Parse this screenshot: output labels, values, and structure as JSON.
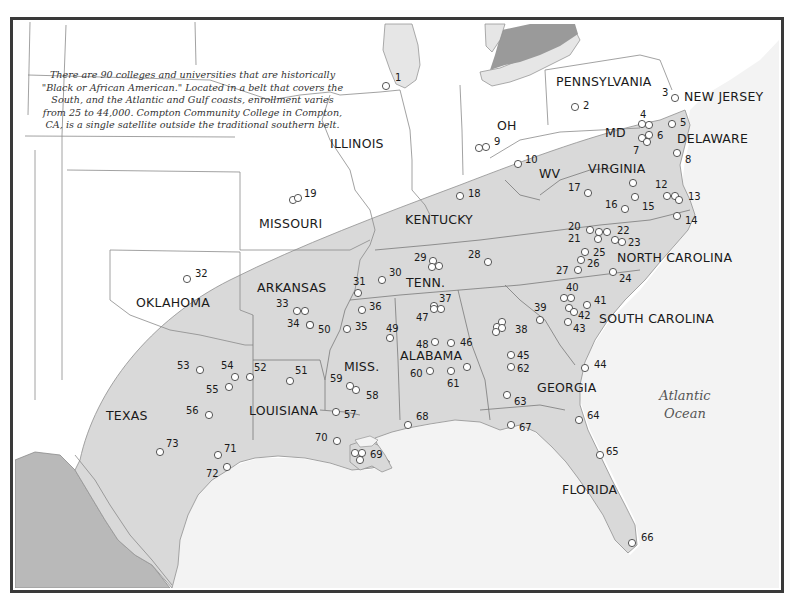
{
  "map": {
    "caption": "There are 90 colleges and universities that are historically \"Black or African American.\" Located in a belt that covers the South, and the Atlantic and Gulf coasts, enrollment varies from 25 to 44,000. Compton Community College in Compton, CA, is a single satellite outside the traditional southern belt.",
    "colors": {
      "belt": "#d9d9d9",
      "mexico": "#b9b9b9",
      "lakes": "#e6e6e6",
      "ontario": "#9a9a9a",
      "ocean": "#f3f3f3",
      "land": "#ffffff",
      "frame": "#3a3a3a"
    },
    "ocean_label": {
      "line1": "Atlantic",
      "line2": "Ocean"
    },
    "state_labels": [
      {
        "name": "PENNSYLVANIA",
        "x": 556,
        "y": 86
      },
      {
        "name": "NEW JERSEY",
        "x": 684,
        "y": 101
      },
      {
        "name": "ILLINOIS",
        "x": 330,
        "y": 148
      },
      {
        "name": "OH",
        "x": 497,
        "y": 130
      },
      {
        "name": "MD",
        "x": 605,
        "y": 137
      },
      {
        "name": "DELAWARE",
        "x": 677,
        "y": 143
      },
      {
        "name": "WV",
        "x": 539,
        "y": 178
      },
      {
        "name": "VIRGINIA",
        "x": 588,
        "y": 173
      },
      {
        "name": "MISSOURI",
        "x": 259,
        "y": 228
      },
      {
        "name": "KENTUCKY",
        "x": 405,
        "y": 224
      },
      {
        "name": "NORTH CAROLINA",
        "x": 617,
        "y": 262
      },
      {
        "name": "ARKANSAS",
        "x": 257,
        "y": 292
      },
      {
        "name": "TENN.",
        "x": 406,
        "y": 287
      },
      {
        "name": "OKLAHOMA",
        "x": 136,
        "y": 307
      },
      {
        "name": "SOUTH CAROLINA",
        "x": 599,
        "y": 323
      },
      {
        "name": "MISS.",
        "x": 344,
        "y": 371
      },
      {
        "name": "ALABAMA",
        "x": 400,
        "y": 360
      },
      {
        "name": "GEORGIA",
        "x": 537,
        "y": 392
      },
      {
        "name": "TEXAS",
        "x": 106,
        "y": 420
      },
      {
        "name": "LOUISIANA",
        "x": 249,
        "y": 415
      },
      {
        "name": "FLORIDA",
        "x": 562,
        "y": 494
      }
    ],
    "colleges": [
      {
        "id": "1",
        "x": 386,
        "y": 86,
        "lx": 395,
        "ly": 81
      },
      {
        "id": "2",
        "x": 575,
        "y": 107,
        "lx": 583,
        "ly": 109
      },
      {
        "id": "3",
        "x": 675,
        "y": 98,
        "lx": 662,
        "ly": 96
      },
      {
        "id": "4",
        "x": 642,
        "y": 124,
        "lx": 640,
        "ly": 118
      },
      {
        "id": "4b",
        "x": 649,
        "y": 125,
        "lx": null,
        "ly": null
      },
      {
        "id": "5",
        "x": 672,
        "y": 124,
        "lx": 680,
        "ly": 126
      },
      {
        "id": "6",
        "x": 649,
        "y": 135,
        "lx": 657,
        "ly": 139
      },
      {
        "id": "6b",
        "x": 642,
        "y": 138,
        "lx": null,
        "ly": null
      },
      {
        "id": "7",
        "x": 647,
        "y": 142,
        "lx": 633,
        "ly": 154
      },
      {
        "id": "8",
        "x": 677,
        "y": 153,
        "lx": 685,
        "ly": 163
      },
      {
        "id": "9",
        "x": 479,
        "y": 148,
        "lx": 494,
        "ly": 145
      },
      {
        "id": "9b",
        "x": 486,
        "y": 147,
        "lx": null,
        "ly": null
      },
      {
        "id": "10",
        "x": 518,
        "y": 164,
        "lx": 525,
        "ly": 163
      },
      {
        "id": "11",
        "x": 633,
        "y": 183,
        "lx": null,
        "ly": null
      },
      {
        "id": "12",
        "x": 667,
        "y": 196,
        "lx": 655,
        "ly": 188
      },
      {
        "id": "13",
        "x": 675,
        "y": 196,
        "lx": 688,
        "ly": 200
      },
      {
        "id": "13b",
        "x": 679,
        "y": 200,
        "lx": null,
        "ly": null
      },
      {
        "id": "14",
        "x": 677,
        "y": 216,
        "lx": 685,
        "ly": 224
      },
      {
        "id": "15",
        "x": 635,
        "y": 197,
        "lx": 642,
        "ly": 210
      },
      {
        "id": "16",
        "x": 625,
        "y": 209,
        "lx": 605,
        "ly": 208
      },
      {
        "id": "17",
        "x": 588,
        "y": 193,
        "lx": 568,
        "ly": 191
      },
      {
        "id": "18",
        "x": 460,
        "y": 196,
        "lx": 468,
        "ly": 197
      },
      {
        "id": "19",
        "x": 293,
        "y": 200,
        "lx": 304,
        "ly": 197
      },
      {
        "id": "19b",
        "x": 298,
        "y": 198,
        "lx": null,
        "ly": null
      },
      {
        "id": "20",
        "x": 590,
        "y": 230,
        "lx": 568,
        "ly": 230
      },
      {
        "id": "21",
        "x": 598,
        "y": 239,
        "lx": 568,
        "ly": 242
      },
      {
        "id": "22",
        "x": 607,
        "y": 232,
        "lx": 617,
        "ly": 234
      },
      {
        "id": "22b",
        "x": 599,
        "y": 232,
        "lx": null,
        "ly": null
      },
      {
        "id": "23",
        "x": 622,
        "y": 242,
        "lx": 628,
        "ly": 246
      },
      {
        "id": "23b",
        "x": 615,
        "y": 240,
        "lx": null,
        "ly": null
      },
      {
        "id": "24",
        "x": 613,
        "y": 272,
        "lx": 619,
        "ly": 282
      },
      {
        "id": "25",
        "x": 585,
        "y": 252,
        "lx": 593,
        "ly": 256
      },
      {
        "id": "26",
        "x": 581,
        "y": 260,
        "lx": 587,
        "ly": 267
      },
      {
        "id": "27",
        "x": 578,
        "y": 270,
        "lx": 556,
        "ly": 274
      },
      {
        "id": "28",
        "x": 488,
        "y": 262,
        "lx": 468,
        "ly": 258
      },
      {
        "id": "29",
        "x": 433,
        "y": 261,
        "lx": 414,
        "ly": 261
      },
      {
        "id": "29b",
        "x": 439,
        "y": 266,
        "lx": null,
        "ly": null
      },
      {
        "id": "29c",
        "x": 432,
        "y": 267,
        "lx": null,
        "ly": null
      },
      {
        "id": "30",
        "x": 382,
        "y": 280,
        "lx": 389,
        "ly": 276
      },
      {
        "id": "31",
        "x": 358,
        "y": 293,
        "lx": 353,
        "ly": 285
      },
      {
        "id": "32",
        "x": 187,
        "y": 279,
        "lx": 195,
        "ly": 277
      },
      {
        "id": "33",
        "x": 297,
        "y": 311,
        "lx": 276,
        "ly": 307
      },
      {
        "id": "33b",
        "x": 305,
        "y": 311,
        "lx": null,
        "ly": null
      },
      {
        "id": "34",
        "x": 310,
        "y": 325,
        "lx": 287,
        "ly": 327
      },
      {
        "id": "35",
        "x": 347,
        "y": 329,
        "lx": 355,
        "ly": 330
      },
      {
        "id": "36",
        "x": 362,
        "y": 310,
        "lx": 369,
        "ly": 310
      },
      {
        "id": "37",
        "x": 441,
        "y": 309,
        "lx": 439,
        "ly": 302
      },
      {
        "id": "37b",
        "x": 434,
        "y": 306,
        "lx": null,
        "ly": null
      },
      {
        "id": "38",
        "x": 497,
        "y": 327,
        "lx": 515,
        "ly": 333
      },
      {
        "id": "38b",
        "x": 502,
        "y": 322,
        "lx": null,
        "ly": null
      },
      {
        "id": "38c",
        "x": 502,
        "y": 328,
        "lx": null,
        "ly": null
      },
      {
        "id": "38d",
        "x": 496,
        "y": 332,
        "lx": null,
        "ly": null
      },
      {
        "id": "39",
        "x": 540,
        "y": 320,
        "lx": 534,
        "ly": 311
      },
      {
        "id": "40",
        "x": 564,
        "y": 298,
        "lx": 566,
        "ly": 291
      },
      {
        "id": "40b",
        "x": 571,
        "y": 298,
        "lx": null,
        "ly": null
      },
      {
        "id": "41",
        "x": 587,
        "y": 305,
        "lx": 594,
        "ly": 304
      },
      {
        "id": "42",
        "x": 569,
        "y": 308,
        "lx": 578,
        "ly": 319
      },
      {
        "id": "42b",
        "x": 574,
        "y": 312,
        "lx": null,
        "ly": null
      },
      {
        "id": "43",
        "x": 568,
        "y": 322,
        "lx": 573,
        "ly": 332
      },
      {
        "id": "44",
        "x": 585,
        "y": 368,
        "lx": 594,
        "ly": 368
      },
      {
        "id": "45",
        "x": 511,
        "y": 355,
        "lx": 517,
        "ly": 359
      },
      {
        "id": "46",
        "x": 451,
        "y": 343,
        "lx": 460,
        "ly": 346
      },
      {
        "id": "47",
        "x": 434,
        "y": 309,
        "lx": 416,
        "ly": 321
      },
      {
        "id": "48",
        "x": 435,
        "y": 342,
        "lx": 416,
        "ly": 348
      },
      {
        "id": "49",
        "x": 390,
        "y": 338,
        "lx": 386,
        "ly": 332
      },
      {
        "id": "50",
        "x": 310,
        "y": 325,
        "lx": 318,
        "ly": 333
      },
      {
        "id": "51",
        "x": 290,
        "y": 381,
        "lx": 295,
        "ly": 374
      },
      {
        "id": "52",
        "x": 250,
        "y": 377,
        "lx": 254,
        "ly": 371
      },
      {
        "id": "53",
        "x": 200,
        "y": 370,
        "lx": 177,
        "ly": 369
      },
      {
        "id": "54",
        "x": 235,
        "y": 377,
        "lx": 221,
        "ly": 369
      },
      {
        "id": "55",
        "x": 229,
        "y": 387,
        "lx": 206,
        "ly": 393
      },
      {
        "id": "56",
        "x": 209,
        "y": 415,
        "lx": 186,
        "ly": 414
      },
      {
        "id": "57",
        "x": 336,
        "y": 412,
        "lx": 344,
        "ly": 418
      },
      {
        "id": "58",
        "x": 356,
        "y": 390,
        "lx": 366,
        "ly": 399
      },
      {
        "id": "59",
        "x": 350,
        "y": 386,
        "lx": 330,
        "ly": 382
      },
      {
        "id": "60",
        "x": 430,
        "y": 371,
        "lx": 410,
        "ly": 377
      },
      {
        "id": "61",
        "x": 451,
        "y": 371,
        "lx": 447,
        "ly": 387
      },
      {
        "id": "61b",
        "x": 467,
        "y": 367,
        "lx": null,
        "ly": null
      },
      {
        "id": "62",
        "x": 511,
        "y": 367,
        "lx": 517,
        "ly": 372
      },
      {
        "id": "63",
        "x": 507,
        "y": 395,
        "lx": 514,
        "ly": 405
      },
      {
        "id": "64",
        "x": 579,
        "y": 420,
        "lx": 587,
        "ly": 419
      },
      {
        "id": "65",
        "x": 600,
        "y": 455,
        "lx": 606,
        "ly": 455
      },
      {
        "id": "66",
        "x": 632,
        "y": 543,
        "lx": 641,
        "ly": 541
      },
      {
        "id": "67",
        "x": 511,
        "y": 425,
        "lx": 519,
        "ly": 431
      },
      {
        "id": "68",
        "x": 408,
        "y": 425,
        "lx": 416,
        "ly": 420
      },
      {
        "id": "69",
        "x": 355,
        "y": 453,
        "lx": 370,
        "ly": 458
      },
      {
        "id": "69b",
        "x": 362,
        "y": 453,
        "lx": null,
        "ly": null
      },
      {
        "id": "69c",
        "x": 360,
        "y": 460,
        "lx": null,
        "ly": null
      },
      {
        "id": "70",
        "x": 337,
        "y": 441,
        "lx": 315,
        "ly": 441
      },
      {
        "id": "71",
        "x": 218,
        "y": 455,
        "lx": 224,
        "ly": 452
      },
      {
        "id": "72",
        "x": 227,
        "y": 467,
        "lx": 206,
        "ly": 477
      },
      {
        "id": "73",
        "x": 160,
        "y": 452,
        "lx": 166,
        "ly": 447
      }
    ]
  }
}
